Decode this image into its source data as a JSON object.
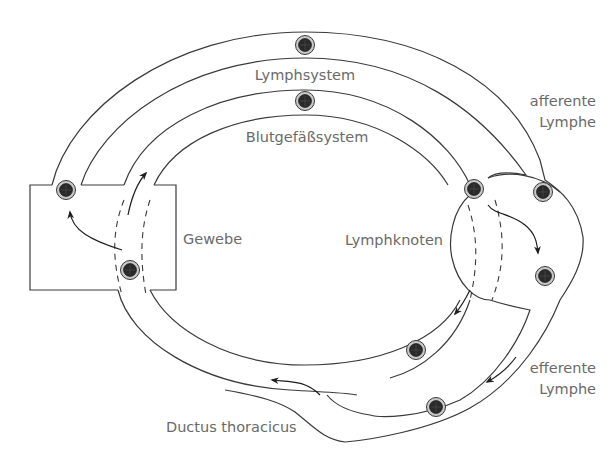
{
  "diagram": {
    "type": "circulation-schematic",
    "labels": {
      "lymph_system": "Lymphsystem",
      "blood_system": "Blutgefäßsystem",
      "tissue": "Gewebe",
      "lymph_node": "Lymphknoten",
      "afferent_line1": "afferente",
      "afferent_line2": "Lymphe",
      "efferent_line1": "efferente",
      "efferent_line2": "Lymphe",
      "thoracic_duct": "Ductus thoracicus"
    },
    "cells": [
      {
        "id": "lymph-top",
        "x": 305,
        "y": 45
      },
      {
        "id": "blood-top",
        "x": 305,
        "y": 101
      },
      {
        "id": "tissue-exit",
        "x": 66,
        "y": 190
      },
      {
        "id": "tissue-entry",
        "x": 130,
        "y": 270
      },
      {
        "id": "node-entry-blood",
        "x": 474,
        "y": 189
      },
      {
        "id": "afferent",
        "x": 543,
        "y": 192
      },
      {
        "id": "node-inner",
        "x": 545,
        "y": 276
      },
      {
        "id": "blood-bottom",
        "x": 416,
        "y": 350
      },
      {
        "id": "efferent",
        "x": 436,
        "y": 407
      }
    ],
    "colors": {
      "line": "#3a3a3a",
      "label": "#6a6a6a",
      "cell_ring": "#c8c8c8",
      "cell_core": "#2a2a2a",
      "background": "#ffffff"
    }
  }
}
